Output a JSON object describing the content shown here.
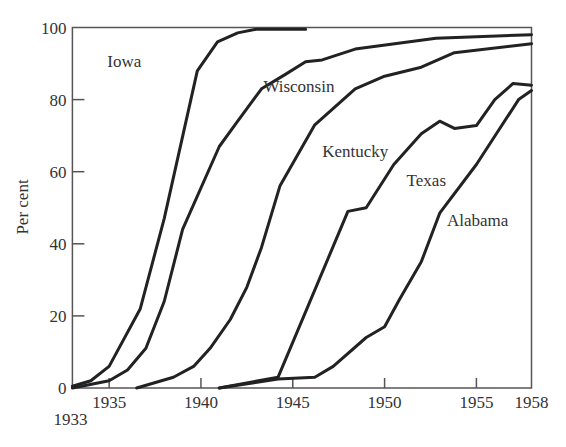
{
  "chart_data": {
    "type": "line",
    "title": "",
    "xlabel": "",
    "ylabel": "Per cent",
    "xlim": [
      1933,
      1958
    ],
    "ylim": [
      0,
      100
    ],
    "grid": false,
    "legend": "inline labels",
    "x_ticks": [
      {
        "value": 1933,
        "label": "1933",
        "offset": "below"
      },
      {
        "value": 1935,
        "label": "1935"
      },
      {
        "value": 1940,
        "label": "1940"
      },
      {
        "value": 1945,
        "label": "1945"
      },
      {
        "value": 1950,
        "label": "1950"
      },
      {
        "value": 1955,
        "label": "1955"
      },
      {
        "value": 1958,
        "label": "1958"
      }
    ],
    "y_ticks": [
      {
        "value": 0,
        "label": "0"
      },
      {
        "value": 20,
        "label": "20"
      },
      {
        "value": 40,
        "label": "40"
      },
      {
        "value": 60,
        "label": "60"
      },
      {
        "value": 80,
        "label": "80"
      },
      {
        "value": 100,
        "label": "100"
      }
    ],
    "series": [
      {
        "name": "Iowa",
        "label_pos": {
          "x": 1934.9,
          "y": 89
        },
        "points": [
          [
            1933,
            0.5
          ],
          [
            1934,
            2
          ],
          [
            1935,
            6
          ],
          [
            1936.7,
            22
          ],
          [
            1938,
            47
          ],
          [
            1939.8,
            88
          ],
          [
            1940.9,
            96
          ],
          [
            1942,
            98.5
          ],
          [
            1943,
            99.5
          ],
          [
            1945.7,
            99.5
          ]
        ]
      },
      {
        "name": "Wisconsin",
        "label_pos": {
          "x": 1943.4,
          "y": 82
        },
        "points": [
          [
            1933,
            0
          ],
          [
            1935,
            2
          ],
          [
            1936,
            5
          ],
          [
            1937,
            11
          ],
          [
            1938,
            24
          ],
          [
            1939,
            44
          ],
          [
            1941,
            67
          ],
          [
            1942,
            74
          ],
          [
            1943.3,
            83
          ],
          [
            1944.6,
            87
          ],
          [
            1945.7,
            90.5
          ],
          [
            1946.6,
            91
          ],
          [
            1948.4,
            94
          ],
          [
            1952.8,
            97
          ],
          [
            1958,
            98
          ]
        ]
      },
      {
        "name": "Kentucky",
        "label_pos": {
          "x": 1946.6,
          "y": 64
        },
        "points": [
          [
            1936.5,
            0
          ],
          [
            1938.5,
            3
          ],
          [
            1939.6,
            6
          ],
          [
            1940.5,
            11
          ],
          [
            1941.6,
            19
          ],
          [
            1942.5,
            28
          ],
          [
            1943.3,
            39
          ],
          [
            1944.3,
            56
          ],
          [
            1946.2,
            73
          ],
          [
            1948.4,
            83
          ],
          [
            1950,
            86.5
          ],
          [
            1952,
            89
          ],
          [
            1953.8,
            93
          ],
          [
            1958,
            95.5
          ]
        ]
      },
      {
        "name": "Texas",
        "label_pos": {
          "x": 1951.2,
          "y": 56
        },
        "points": [
          [
            1941,
            0
          ],
          [
            1944.2,
            3
          ],
          [
            1948,
            49
          ],
          [
            1949,
            50
          ],
          [
            1950.5,
            62
          ],
          [
            1952,
            70.5
          ],
          [
            1953,
            74
          ],
          [
            1953.8,
            72
          ],
          [
            1955,
            72.8
          ],
          [
            1956,
            80
          ],
          [
            1957,
            84.5
          ],
          [
            1958,
            84
          ]
        ]
      },
      {
        "name": "Alabama",
        "label_pos": {
          "x": 1953.4,
          "y": 45
        },
        "points": [
          [
            1941,
            0
          ],
          [
            1944.2,
            2.5
          ],
          [
            1946.2,
            3
          ],
          [
            1947.2,
            6
          ],
          [
            1949,
            14
          ],
          [
            1950,
            17
          ],
          [
            1950.8,
            24.5
          ],
          [
            1952,
            35
          ],
          [
            1953,
            48.5
          ],
          [
            1955,
            62
          ],
          [
            1957.3,
            80
          ],
          [
            1958,
            82.5
          ]
        ]
      }
    ]
  }
}
